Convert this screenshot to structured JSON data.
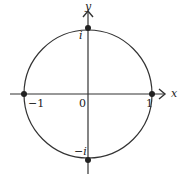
{
  "diagram": {
    "axes": {
      "x_label": "x",
      "y_label": "y"
    },
    "labels": {
      "origin": "0",
      "pos_one": "1",
      "neg_one": "−1",
      "pos_i": "i",
      "neg_i": "−i"
    },
    "points": [
      {
        "name": "1",
        "coord": [
          1,
          0
        ]
      },
      {
        "name": "-1",
        "coord": [
          -1,
          0
        ]
      },
      {
        "name": "i",
        "coord": [
          0,
          1
        ]
      },
      {
        "name": "-i",
        "coord": [
          0,
          -1
        ]
      }
    ],
    "colors": {
      "stroke": "#333333",
      "background": "#ffffff"
    }
  }
}
